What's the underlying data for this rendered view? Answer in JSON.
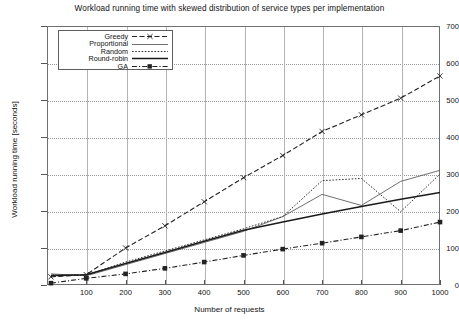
{
  "chart_data": {
    "type": "line",
    "title": "Workload running time with skewed distribution of service types per implementation",
    "xlabel": "Number of requests",
    "ylabel": "Workload running time [seconds]",
    "xlim": [
      0,
      1000
    ],
    "ylim": [
      0,
      700
    ],
    "xticks": [
      100,
      200,
      300,
      400,
      500,
      600,
      700,
      800,
      900,
      1000
    ],
    "yticks": [
      0,
      100,
      200,
      300,
      400,
      500,
      600,
      700
    ],
    "grid": true,
    "legend_position": "top-left inside",
    "x": [
      10,
      100,
      200,
      300,
      400,
      500,
      600,
      700,
      800,
      900,
      1000
    ],
    "series": [
      {
        "name": "Greedy",
        "style": "dashed-with-x-markers",
        "color": "#222222",
        "values": [
          22,
          28,
          100,
          160,
          225,
          290,
          350,
          415,
          460,
          505,
          565
        ]
      },
      {
        "name": "Proportional",
        "style": "dashed-thin",
        "color": "#555555",
        "values": [
          30,
          25,
          55,
          85,
          115,
          145,
          185,
          245,
          215,
          280,
          310
        ]
      },
      {
        "name": "Random",
        "style": "dotted",
        "color": "#333333",
        "values": [
          24,
          27,
          62,
          92,
          122,
          152,
          185,
          282,
          288,
          198,
          300
        ]
      },
      {
        "name": "Round-robin",
        "style": "solid",
        "color": "#1a1a1a",
        "values": [
          26,
          28,
          58,
          88,
          118,
          148,
          170,
          192,
          212,
          232,
          250
        ]
      },
      {
        "name": "GA",
        "style": "dash-dot-with-square-markers",
        "color": "#222222",
        "values": [
          5,
          18,
          30,
          45,
          62,
          80,
          97,
          113,
          130,
          147,
          170
        ]
      }
    ]
  }
}
